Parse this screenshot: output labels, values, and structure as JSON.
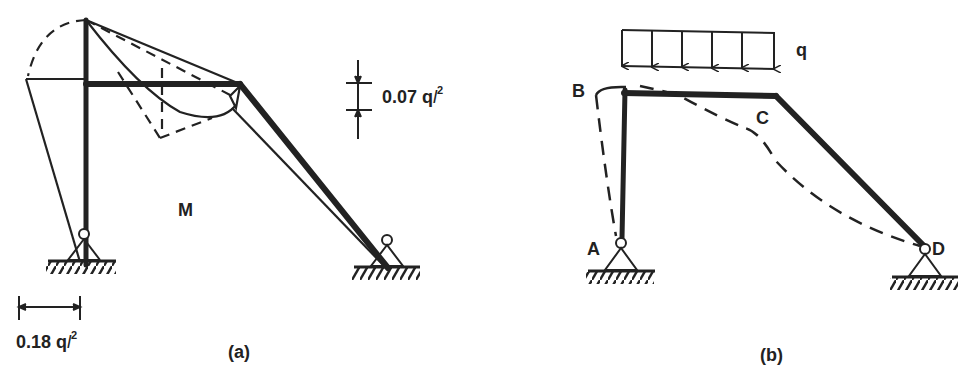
{
  "figure_a": {
    "caption": "(a)",
    "diagram_label": "M",
    "dim_top": {
      "value": "0.07 q",
      "var": "l",
      "exp": "2"
    },
    "dim_bottom": {
      "value": "0.18 q",
      "var": "l",
      "exp": "2"
    }
  },
  "figure_b": {
    "caption": "(b)",
    "load_label": "q",
    "nodes": {
      "A": "A",
      "B": "B",
      "C": "C",
      "D": "D"
    }
  },
  "colors": {
    "ink": "#222222",
    "background": "#ffffff"
  }
}
